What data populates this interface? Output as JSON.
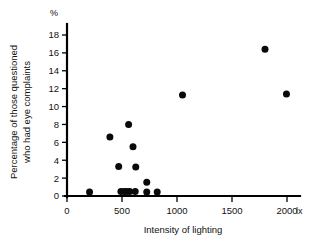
{
  "chart_data": {
    "type": "scatter",
    "title": "",
    "xlabel": "Intensity of lighting",
    "ylabel": "Percentage of those questioned who had eye complaints",
    "ylabel_line1": "Percentage of those questioned",
    "ylabel_line2": "who had eye complaints",
    "x_unit": "lx",
    "y_unit": "%",
    "xlim": [
      0,
      2100
    ],
    "ylim": [
      0,
      19
    ],
    "grid": false,
    "legend": false,
    "marker": "filled-circle",
    "marker_color": "#0a0a0a",
    "xticks": [
      0,
      500,
      1000,
      1500,
      2000
    ],
    "xtick_labels": [
      "0",
      "500",
      "1000",
      "1500",
      "2000"
    ],
    "yticks": [
      0,
      2,
      4,
      6,
      8,
      10,
      12,
      14,
      16,
      18
    ],
    "ytick_labels": [
      "0",
      "2",
      "4",
      "6",
      "8",
      "10",
      "12",
      "14",
      "16",
      "18"
    ],
    "points": [
      {
        "x": 205,
        "y": 0.45
      },
      {
        "x": 390,
        "y": 6.6
      },
      {
        "x": 470,
        "y": 3.3
      },
      {
        "x": 490,
        "y": 0.5
      },
      {
        "x": 520,
        "y": 0.5
      },
      {
        "x": 545,
        "y": 0.5
      },
      {
        "x": 570,
        "y": 0.5
      },
      {
        "x": 560,
        "y": 8.0
      },
      {
        "x": 600,
        "y": 5.5
      },
      {
        "x": 625,
        "y": 3.25
      },
      {
        "x": 620,
        "y": 0.5
      },
      {
        "x": 725,
        "y": 1.55
      },
      {
        "x": 725,
        "y": 0.45
      },
      {
        "x": 820,
        "y": 0.45
      },
      {
        "x": 1050,
        "y": 11.3
      },
      {
        "x": 1800,
        "y": 16.4
      },
      {
        "x": 1995,
        "y": 11.4
      }
    ]
  },
  "axes": {
    "y_axis_name": "percentage-axis",
    "x_axis_name": "intensity-axis"
  }
}
